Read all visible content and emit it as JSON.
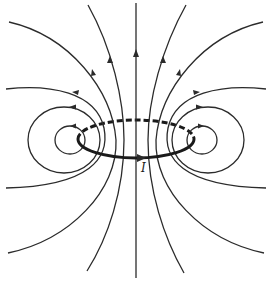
{
  "diagram": {
    "current_label": "I",
    "colors": {
      "background": "#ffffff",
      "lines": "#2b2b2b",
      "loop": "#1a1a1a"
    },
    "elements": {
      "axis": "vertical symmetry axis through loop center, field directed upward",
      "loop": "elliptical current loop in perspective, back half dashed, front half solid with arrow pointing right",
      "field_lines_per_side": 5
    }
  }
}
